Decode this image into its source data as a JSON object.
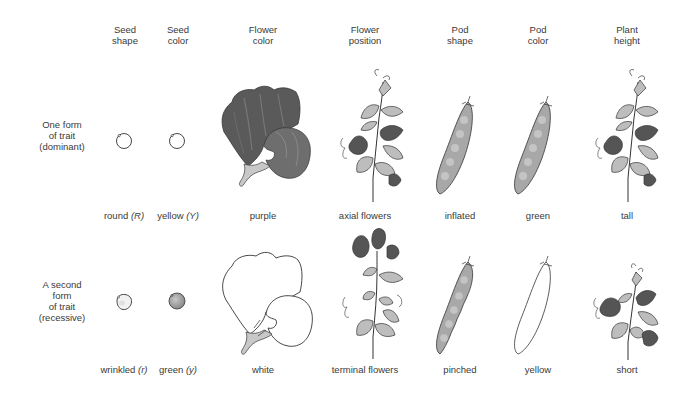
{
  "columns": [
    {
      "key": "seed_shape",
      "line1": "Seed",
      "line2": "shape"
    },
    {
      "key": "seed_color",
      "line1": "Seed",
      "line2": "color"
    },
    {
      "key": "flower_color",
      "line1": "Flower",
      "line2": "color"
    },
    {
      "key": "flower_position",
      "line1": "Flower",
      "line2": "position"
    },
    {
      "key": "pod_shape",
      "line1": "Pod",
      "line2": "shape"
    },
    {
      "key": "pod_color",
      "line1": "Pod",
      "line2": "color"
    },
    {
      "key": "plant_height",
      "line1": "Plant",
      "line2": "height"
    }
  ],
  "rows": [
    {
      "key": "dominant",
      "label_lines": [
        "One form",
        "of trait",
        "(dominant)"
      ],
      "traits": [
        {
          "text": "round",
          "allele": "(R)",
          "icon": "round-seed-icon"
        },
        {
          "text": "yellow",
          "allele": "(Y)",
          "icon": "yellow-seed-icon"
        },
        {
          "text": "purple",
          "allele": "",
          "icon": "purple-flower-icon"
        },
        {
          "text": "axial flowers",
          "allele": "",
          "icon": "axial-flowers-plant-icon"
        },
        {
          "text": "inflated",
          "allele": "",
          "icon": "inflated-pod-icon"
        },
        {
          "text": "green",
          "allele": "",
          "icon": "green-pod-icon"
        },
        {
          "text": "tall",
          "allele": "",
          "icon": "tall-plant-icon"
        }
      ]
    },
    {
      "key": "recessive",
      "label_lines": [
        "A second",
        "form",
        "of trait",
        "(recessive)"
      ],
      "traits": [
        {
          "text": "wrinkled",
          "allele": "(r)",
          "icon": "wrinkled-seed-icon"
        },
        {
          "text": "green",
          "allele": "(y)",
          "icon": "green-seed-icon"
        },
        {
          "text": "white",
          "allele": "",
          "icon": "white-flower-icon"
        },
        {
          "text": "terminal flowers",
          "allele": "",
          "icon": "terminal-flowers-plant-icon"
        },
        {
          "text": "pinched",
          "allele": "",
          "icon": "pinched-pod-icon"
        },
        {
          "text": "yellow",
          "allele": "",
          "icon": "yellow-pod-icon"
        },
        {
          "text": "short",
          "allele": "",
          "icon": "short-plant-icon"
        }
      ]
    }
  ],
  "colors": {
    "text": "#3a3a3a",
    "outline": "#333333",
    "dark_petal": "#555555",
    "mid_gray": "#9a9a9a",
    "leaf": "#bdbdbd",
    "pod": "#a8a8a8",
    "green_seed": "#9e9e9e"
  }
}
